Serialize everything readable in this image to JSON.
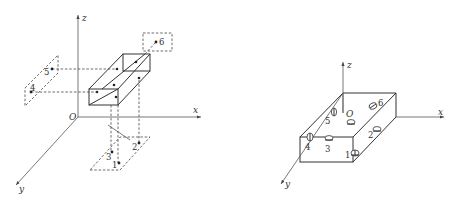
{
  "figure": {
    "left_panel": {
      "axes": {
        "origin": "O",
        "x": "x",
        "y": "y",
        "z": "z"
      },
      "points": [
        {
          "id": "1",
          "label": "1"
        },
        {
          "id": "2",
          "label": "2"
        },
        {
          "id": "3",
          "label": "3"
        },
        {
          "id": "4",
          "label": "4"
        },
        {
          "id": "5",
          "label": "5"
        },
        {
          "id": "6",
          "label": "6"
        }
      ]
    },
    "right_panel": {
      "axes": {
        "origin": "O",
        "x": "x",
        "y": "y",
        "z": "z"
      },
      "points": [
        {
          "id": "1",
          "label": "1"
        },
        {
          "id": "2",
          "label": "2"
        },
        {
          "id": "3",
          "label": "3"
        },
        {
          "id": "4",
          "label": "4"
        },
        {
          "id": "5",
          "label": "5"
        },
        {
          "id": "6",
          "label": "6"
        }
      ]
    }
  }
}
